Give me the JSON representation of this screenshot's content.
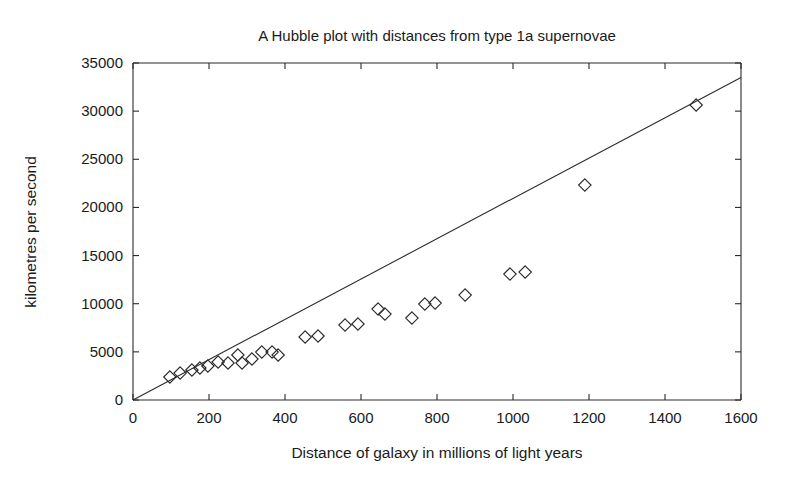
{
  "chart_data": {
    "type": "scatter",
    "title": "A Hubble plot with distances from type 1a supernovae",
    "xlabel": "Distance of galaxy in millions of light years",
    "ylabel": "kilometres per second",
    "xlim": [
      0,
      1600
    ],
    "ylim": [
      0,
      35000
    ],
    "xticks": [
      0,
      200,
      400,
      600,
      800,
      1000,
      1200,
      1400,
      1600
    ],
    "yticks": [
      0,
      5000,
      10000,
      15000,
      20000,
      25000,
      30000,
      35000
    ],
    "xtick_labels": [
      "0",
      "200",
      "400",
      "600",
      "800",
      "1000",
      "1200",
      "1400",
      "1600"
    ],
    "ytick_labels": [
      "0",
      "5000",
      "10000",
      "15000",
      "20000",
      "25000",
      "30000",
      "35000"
    ],
    "grid": false,
    "legend": null,
    "marker_style": "open-diamond",
    "marker_color": "#2b2b2b",
    "line_color": "#2b2b2b",
    "series": [
      {
        "name": "type 1a supernovae",
        "x": [
          97,
          124,
          155,
          176,
          197,
          224,
          250,
          276,
          287,
          313,
          339,
          366,
          382,
          453,
          487,
          558,
          592,
          645,
          663,
          734,
          768,
          795,
          874,
          992,
          1032,
          1189,
          1482
        ],
        "y": [
          2390,
          2800,
          3115,
          3320,
          3530,
          3945,
          3840,
          4670,
          3840,
          4255,
          4980,
          4980,
          4670,
          6540,
          6645,
          7785,
          7890,
          9445,
          8925,
          8510,
          9965,
          10070,
          10900,
          13080,
          13290,
          22325,
          30635
        ]
      }
    ],
    "fit_line": {
      "name": "Hubble law best fit",
      "x_start": 0,
      "y_start": 0,
      "x_end": 1600,
      "y_end": 33500,
      "slope": 20.94
    }
  },
  "axes_geometry": {
    "left_px": 133,
    "right_px": 741,
    "top_px": 63,
    "bottom_px": 400
  }
}
